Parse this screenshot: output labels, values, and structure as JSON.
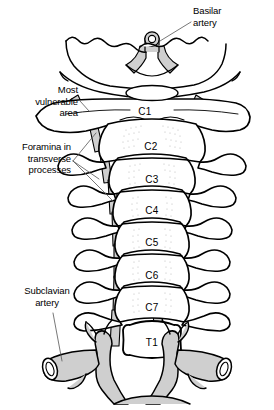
{
  "figure": {
    "width": 274,
    "height": 410,
    "background_color": "#ffffff",
    "line_color": "#000000",
    "artery_fill_color": "#cfcfcf",
    "bone_fill_color": "#ffffff",
    "stipple_color": "#b5b5b5"
  },
  "callouts": [
    {
      "id": "basilar-artery",
      "text": "Basilar\nartery",
      "align": "left",
      "x": 193,
      "y": 6,
      "leader": {
        "x1": 191,
        "y1": 22,
        "x2": 160,
        "y2": 41
      }
    },
    {
      "id": "most-vulnerable-area",
      "text": "Most\nvulnerable\narea",
      "align": "right",
      "x": 6,
      "y": 85,
      "width": 72,
      "leader": {
        "x1": 80,
        "y1": 100,
        "x2": 86,
        "y2": 110
      }
    },
    {
      "id": "foramina-in-transverse-processes",
      "text": "Foramina in\ntransverse\nprocesses",
      "align": "right",
      "x": 2,
      "y": 142,
      "width": 68,
      "leaders": [
        {
          "x1": 72,
          "y1": 160,
          "x2": 96,
          "y2": 132
        },
        {
          "x1": 72,
          "y1": 160,
          "x2": 97,
          "y2": 178
        },
        {
          "x1": 72,
          "y1": 160,
          "x2": 112,
          "y2": 200
        }
      ]
    },
    {
      "id": "subclavian-artery",
      "text": "Subclavian\nartery",
      "align": "center",
      "x": 14,
      "y": 286,
      "width": 66,
      "leader": {
        "x1": 52,
        "y1": 312,
        "x2": 62,
        "y2": 360
      }
    }
  ],
  "vertebrae": [
    {
      "id": "c1",
      "label": "C1",
      "x": 145,
      "y": 107
    },
    {
      "id": "c2",
      "label": "C2",
      "x": 151,
      "y": 142
    },
    {
      "id": "c3",
      "label": "C3",
      "x": 152,
      "y": 175
    },
    {
      "id": "c4",
      "label": "C4",
      "x": 152,
      "y": 206
    },
    {
      "id": "c5",
      "label": "C5",
      "x": 152,
      "y": 238
    },
    {
      "id": "c6",
      "label": "C6",
      "x": 152,
      "y": 271
    },
    {
      "id": "c7",
      "label": "C7",
      "x": 152,
      "y": 303
    },
    {
      "id": "t1",
      "label": "T1",
      "x": 152,
      "y": 338
    }
  ],
  "structures": [
    {
      "id": "occiput",
      "name": "occipital-bone"
    },
    {
      "id": "basilar-artery-vessel",
      "name": "basilar-artery-vessel"
    },
    {
      "id": "vertebral-artery-left",
      "name": "vertebral-artery-left"
    },
    {
      "id": "vertebral-artery-right",
      "name": "vertebral-artery-right"
    },
    {
      "id": "subclavian-artery-left",
      "name": "subclavian-artery-left"
    },
    {
      "id": "subclavian-artery-right",
      "name": "subclavian-artery-right"
    },
    {
      "id": "aortic-arch",
      "name": "aortic-arch"
    }
  ]
}
